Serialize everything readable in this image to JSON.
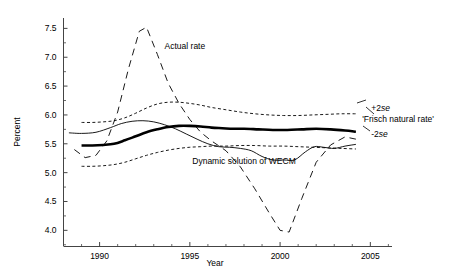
{
  "figure": {
    "background_color": "#ffffff",
    "line_color": "#000000"
  },
  "chart_data": {
    "type": "line",
    "title": "",
    "subtitle": "",
    "xlabel": "Year",
    "ylabel": "Percent",
    "xlim": [
      1988.0,
      2006.2
    ],
    "ylim": [
      3.72,
      7.68
    ],
    "grid": false,
    "legend_position": "inline-annotations",
    "x_ticks": [
      1990,
      1995,
      2000,
      2005
    ],
    "x_tick_labels": [
      "1990",
      "1995",
      "2000",
      "2005"
    ],
    "x_minor_ticks": [
      1989,
      1991,
      1992,
      1993,
      1994,
      1996,
      1997,
      1998,
      1999,
      2001,
      2002,
      2003,
      2004,
      2006
    ],
    "y_ticks": [
      4.0,
      4.5,
      5.0,
      5.5,
      6.0,
      6.5,
      7.0,
      7.5
    ],
    "y_tick_labels": [
      "4.0",
      "4.5",
      "5.0",
      "5.5",
      "6.0",
      "6.5",
      "7.0",
      "7.5"
    ],
    "series": [
      {
        "name": "Actual rate",
        "style": "long-dashed",
        "label": "Actual rate",
        "label_x": 1993.6,
        "label_y": 7.15,
        "x": [
          1988.6,
          1989.2,
          1989.8,
          1990.4,
          1991.0,
          1991.6,
          1992.2,
          1992.6,
          1993.2,
          1993.8,
          1994.4,
          1995.0,
          1995.6,
          1996.2,
          1997.0,
          1997.8,
          1998.6,
          1999.4,
          2000.0,
          2000.5,
          2001.2,
          2002.0,
          2002.8,
          2003.6,
          2004.2
        ],
        "y": [
          5.4,
          5.26,
          5.3,
          5.55,
          6.05,
          6.8,
          7.45,
          7.52,
          7.05,
          6.55,
          6.2,
          5.92,
          5.7,
          5.55,
          5.38,
          5.1,
          4.72,
          4.3,
          4.0,
          3.97,
          4.55,
          5.18,
          5.48,
          5.62,
          5.58
        ]
      },
      {
        "name": "Frisch natural rate",
        "style": "solid-bold",
        "label": "'Frisch natural rate'",
        "label_x": 2005.1,
        "label_y": 5.88,
        "x": [
          1989.0,
          1989.6,
          1990.2,
          1990.8,
          1991.4,
          1992.0,
          1992.6,
          1993.2,
          1993.8,
          1994.4,
          1995.0,
          1995.6,
          1996.2,
          1996.8,
          1997.4,
          1998.0,
          1998.8,
          1999.6,
          2000.4,
          2001.2,
          2002.0,
          2002.8,
          2003.6,
          2004.2
        ],
        "y": [
          5.47,
          5.47,
          5.48,
          5.5,
          5.56,
          5.63,
          5.7,
          5.75,
          5.79,
          5.81,
          5.81,
          5.8,
          5.78,
          5.77,
          5.76,
          5.76,
          5.75,
          5.74,
          5.74,
          5.75,
          5.76,
          5.75,
          5.73,
          5.71
        ]
      },
      {
        "name": "+2se",
        "style": "short-dashed",
        "label": "+2se",
        "label_x": 2005.05,
        "label_y": 6.06,
        "x": [
          1989.0,
          1989.6,
          1990.2,
          1990.8,
          1991.4,
          1992.0,
          1992.6,
          1993.2,
          1993.8,
          1994.4,
          1995.0,
          1995.6,
          1996.2,
          1997.0,
          1997.8,
          1998.6,
          1999.4,
          2000.2,
          2001.0,
          2001.8,
          2002.6,
          2003.4,
          2004.2
        ],
        "y": [
          5.87,
          5.87,
          5.88,
          5.9,
          5.95,
          6.03,
          6.12,
          6.19,
          6.22,
          6.22,
          6.2,
          6.17,
          6.13,
          6.09,
          6.05,
          6.02,
          6.0,
          5.99,
          5.99,
          6.0,
          6.01,
          6.02,
          6.02
        ]
      },
      {
        "name": "-2se",
        "style": "short-dashed",
        "label": "-2se",
        "label_x": 2005.05,
        "label_y": 5.62,
        "x": [
          1989.0,
          1989.6,
          1990.2,
          1990.8,
          1991.4,
          1992.0,
          1992.6,
          1993.2,
          1993.8,
          1994.4,
          1995.0,
          1995.6,
          1996.2,
          1997.0,
          1997.8,
          1998.6,
          1999.4,
          2000.2,
          2001.0,
          2001.8,
          2002.6,
          2003.4,
          2004.2
        ],
        "y": [
          5.11,
          5.11,
          5.12,
          5.14,
          5.18,
          5.24,
          5.3,
          5.35,
          5.39,
          5.42,
          5.44,
          5.45,
          5.46,
          5.46,
          5.47,
          5.47,
          5.46,
          5.46,
          5.45,
          5.44,
          5.43,
          5.42,
          5.41
        ]
      },
      {
        "name": "Dynamic solution of WECM",
        "style": "solid-thin",
        "label": "Dynamic solution of  WECM",
        "label_x": 1998.0,
        "label_y": 5.15,
        "x": [
          1988.3,
          1989.0,
          1989.8,
          1990.6,
          1991.2,
          1991.8,
          1992.4,
          1993.0,
          1993.6,
          1994.2,
          1994.8,
          1995.4,
          1996.0,
          1996.6,
          1997.2,
          1997.8,
          1998.4,
          1999.0,
          1999.6,
          2000.2,
          2000.8,
          2001.4,
          2001.9,
          2002.4,
          2003.0,
          2003.6,
          2004.2
        ],
        "y": [
          5.69,
          5.68,
          5.7,
          5.78,
          5.85,
          5.89,
          5.9,
          5.88,
          5.83,
          5.76,
          5.67,
          5.58,
          5.5,
          5.45,
          5.44,
          5.42,
          5.38,
          5.28,
          5.22,
          5.22,
          5.22,
          5.36,
          5.45,
          5.44,
          5.42,
          5.46,
          5.49
        ]
      }
    ],
    "annotations": [
      {
        "text": "Actual rate",
        "x": 1993.6,
        "y": 7.15
      },
      {
        "text": "'Frisch natural rate'",
        "x": 2005.1,
        "y": 5.88
      },
      {
        "text": "+2se",
        "x": 2005.05,
        "y": 6.06
      },
      {
        "text": "-2se",
        "x": 2005.05,
        "y": 5.62
      },
      {
        "text": "Dynamic solution of  WECM",
        "x": 1998.0,
        "y": 5.15
      }
    ]
  }
}
